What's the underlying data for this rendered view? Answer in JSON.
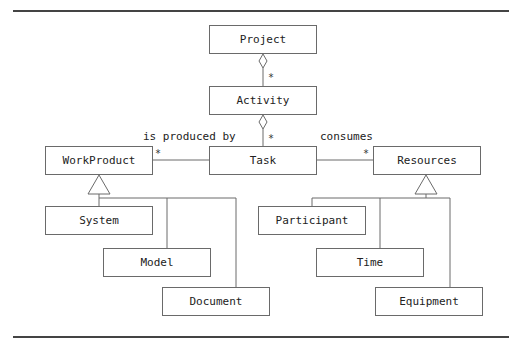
{
  "diagram": {
    "type": "uml-class-diagram",
    "classes": {
      "project": "Project",
      "activity": "Activity",
      "task": "Task",
      "workproduct": "WorkProduct",
      "resources": "Resources",
      "system": "System",
      "model": "Model",
      "document": "Document",
      "participant": "Participant",
      "time": "Time",
      "equipment": "Equipment"
    },
    "associations": {
      "produced_label": "is produced by",
      "consumes_label": "consumes",
      "project_activity_mult": "*",
      "activity_task_mult": "*",
      "task_workproduct_mult": "*",
      "task_resources_mult": "*"
    },
    "relationships": [
      {
        "from": "Project",
        "to": "Activity",
        "kind": "aggregation",
        "multiplicity": "*"
      },
      {
        "from": "Activity",
        "to": "Task",
        "kind": "aggregation",
        "multiplicity": "*"
      },
      {
        "from": "Task",
        "to": "WorkProduct",
        "kind": "association",
        "label": "is produced by",
        "multiplicity": "*"
      },
      {
        "from": "Task",
        "to": "Resources",
        "kind": "association",
        "label": "consumes",
        "multiplicity": "*"
      },
      {
        "parent": "WorkProduct",
        "children": [
          "System",
          "Model",
          "Document"
        ],
        "kind": "generalization"
      },
      {
        "parent": "Resources",
        "children": [
          "Participant",
          "Time",
          "Equipment"
        ],
        "kind": "generalization"
      }
    ]
  }
}
